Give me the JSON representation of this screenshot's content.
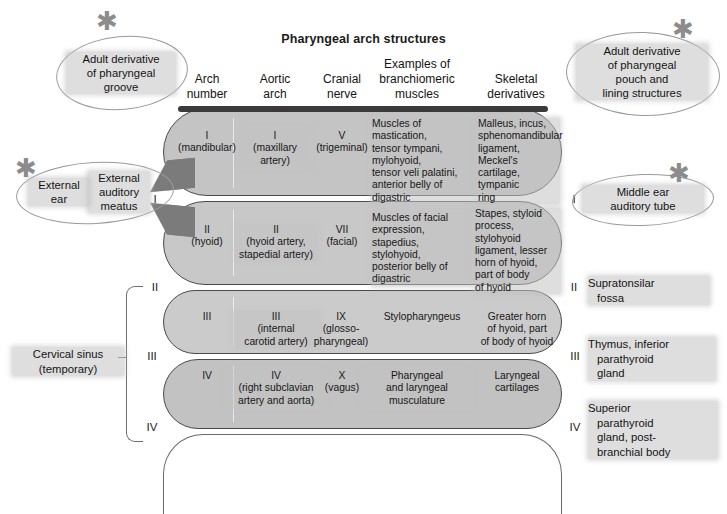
{
  "title": "Pharyngeal arch structures",
  "columns": [
    {
      "id": "arch-number",
      "line1": "Arch",
      "line2": "number"
    },
    {
      "id": "aortic-arch",
      "line1": "Aortic",
      "line2": "arch"
    },
    {
      "id": "cranial-nerve",
      "line1": "Cranial",
      "line2": "nerve"
    },
    {
      "id": "branchiomeric-muscles",
      "line1": "Examples of",
      "line2": "branchiomeric",
      "line3": "muscles"
    },
    {
      "id": "skeletal-derivatives",
      "line1": "Skeletal",
      "line2": "derivatives"
    }
  ],
  "arches": [
    {
      "id": "arch-1",
      "arch_number": "I\n(mandibular)",
      "aortic_arch": "I\n(maxillary\nartery)",
      "cranial_nerve": "V\n(trigeminal)",
      "muscles": "Muscles of mastication,\ntensor tympani,\nmylohyoid,\ntensor veli palatini,\nanterior belly of\ndigastric",
      "skeletal": "Malleus, incus,\nsphenomandibular\nligament, Meckel's\ncartilage, tympanic\nring",
      "numeral_left": "I",
      "numeral_right": "I"
    },
    {
      "id": "arch-2",
      "arch_number": "II\n(hyoid)",
      "aortic_arch": "II\n(hyoid artery,\nstapedial artery)",
      "cranial_nerve": "VII\n(facial)",
      "muscles": "Muscles of facial\nexpression,\nstapedius,\nstylohyoid,\nposterior belly of\ndigastric",
      "skeletal": "Stapes, styloid\nprocess, stylohyoid\nligament, lesser\nhorn of hyoid,\npart of body\nof hyoid",
      "numeral_left": "II",
      "numeral_right": "II"
    },
    {
      "id": "arch-3",
      "arch_number": "III",
      "aortic_arch": "III\n(internal\ncarotid artery)",
      "cranial_nerve": "IX\n(glosso-\npharyngeal)",
      "muscles": "Stylopharyngeus",
      "skeletal": "Greater horn\nof hyoid, part\nof body of hyoid",
      "numeral_left": "III",
      "numeral_right": "III"
    },
    {
      "id": "arch-4",
      "arch_number": "IV",
      "aortic_arch": "IV\n(right subclavian\nartery and aorta)",
      "cranial_nerve": "X\n(vagus)",
      "muscles": "Pharyngeal\nand laryngeal\nmusculature",
      "skeletal": "Laryngeal\ncartilages",
      "numeral_left": "IV",
      "numeral_right": "IV"
    }
  ],
  "callouts": {
    "groove": "Adult derivative\nof pharyngeal\ngroove",
    "pouch": "Adult derivative\nof pharyngeal\npouch and\nlining structures",
    "external_ear": "External\near",
    "external_auditory_meatus": "External\nauditory\nmeatus",
    "middle_ear": "Middle ear\nauditory tube"
  },
  "right_labels": [
    {
      "id": "supratonsilar-fossa",
      "line1": "Supratonsilar",
      "line2": "fossa",
      "line3": "",
      "line4": ""
    },
    {
      "id": "thymus-inferior-parathyroid",
      "line1": "Thymus, inferior",
      "line2": "parathyroid",
      "line3": "gland",
      "line4": ""
    },
    {
      "id": "superior-parathyroid",
      "line1": "Superior",
      "line2": "parathyroid",
      "line3": "gland, post-",
      "line4": "branchial body"
    }
  ],
  "left_labels": {
    "cervical_sinus": "Cervical sinus\n(temporary)"
  },
  "colors": {
    "arch_fill": "#c6c6c6",
    "arch_stroke": "#4a4a4a",
    "wedge": "#7b7b7b",
    "top_bar": "#3a3a3a",
    "highlight": "#c3c3c3",
    "callout_stroke": "#9a9a9a",
    "text": "#141414"
  }
}
